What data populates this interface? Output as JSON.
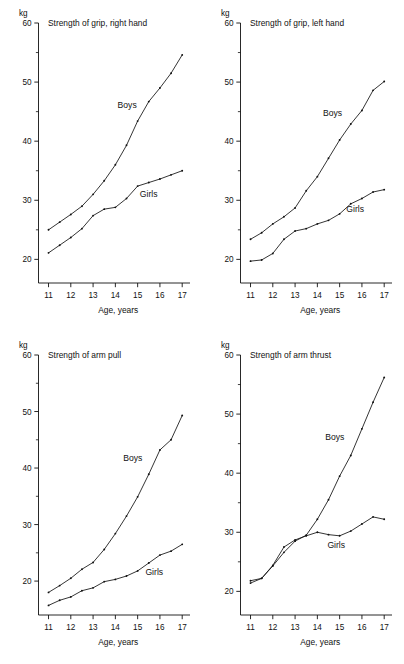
{
  "figure": {
    "panel_count": 4,
    "background": "#ffffff",
    "ink": "#111111"
  },
  "chart_data": [
    {
      "id": "grip-right-hand",
      "type": "line",
      "title": "Strength of grip, right hand",
      "xlabel": "Age, years",
      "ylabel": "kg",
      "unit": "kg",
      "xlim": [
        10.55,
        17.35
      ],
      "ylim": [
        16.0,
        60.0
      ],
      "xticks": [
        11,
        12,
        13,
        14,
        15,
        16,
        17
      ],
      "xticklabels": [
        "11",
        "12",
        "13",
        "14",
        "15",
        "16",
        "17"
      ],
      "yticks": [
        20,
        30,
        40,
        50,
        60
      ],
      "yticklabels": [
        "20",
        "30",
        "40",
        "50",
        "60"
      ],
      "yminorticks": [
        25,
        35,
        45,
        55
      ],
      "grid": false,
      "legend": "inline-annotation",
      "x": [
        11,
        11.5,
        12,
        12.5,
        13,
        13.5,
        14,
        14.5,
        15,
        15.5,
        16,
        16.5,
        17
      ],
      "series": [
        {
          "name": "Boys",
          "label_x": 14.1,
          "label_y": 45.6,
          "values": [
            25.0,
            26.3,
            27.6,
            29.0,
            31.0,
            33.3,
            36.0,
            39.3,
            43.4,
            46.7,
            49.0,
            51.5,
            54.6
          ]
        },
        {
          "name": "Girls",
          "label_x": 15.1,
          "label_y": 30.6,
          "values": [
            21.1,
            22.4,
            23.7,
            25.2,
            27.4,
            28.5,
            28.8,
            30.3,
            32.4,
            33.0,
            33.6,
            34.3,
            35.0
          ]
        }
      ]
    },
    {
      "id": "grip-left-hand",
      "type": "line",
      "title": "Strength of grip, left hand",
      "xlabel": "Age, years",
      "ylabel": "kg",
      "unit": "kg",
      "xlim": [
        10.55,
        17.35
      ],
      "ylim": [
        16.0,
        60.0
      ],
      "xticks": [
        11,
        12,
        13,
        14,
        15,
        16,
        17
      ],
      "xticklabels": [
        "11",
        "12",
        "13",
        "14",
        "15",
        "16",
        "17"
      ],
      "yticks": [
        20,
        30,
        40,
        50,
        60
      ],
      "yticklabels": [
        "20",
        "30",
        "40",
        "50",
        "60"
      ],
      "yminorticks": [
        25,
        35,
        45,
        55
      ],
      "grid": false,
      "legend": "inline-annotation",
      "x": [
        11,
        11.5,
        12,
        12.5,
        13,
        13.5,
        14,
        14.5,
        15,
        15.5,
        16,
        16.5,
        17
      ],
      "series": [
        {
          "name": "Boys",
          "label_x": 14.25,
          "label_y": 44.2,
          "values": [
            23.4,
            24.5,
            26.0,
            27.2,
            28.7,
            31.6,
            34.0,
            37.1,
            40.2,
            42.9,
            45.2,
            48.6,
            50.1
          ]
        },
        {
          "name": "Girls",
          "label_x": 15.3,
          "label_y": 28.0,
          "values": [
            19.7,
            19.9,
            21.0,
            23.4,
            24.8,
            25.2,
            26.0,
            26.6,
            27.7,
            29.4,
            30.3,
            31.4,
            31.8
          ]
        }
      ]
    },
    {
      "id": "arm-pull",
      "type": "line",
      "title": "Strength of arm pull",
      "xlabel": "Age, years",
      "ylabel": "kg",
      "unit": "kg",
      "xlim": [
        10.55,
        17.35
      ],
      "ylim": [
        14.0,
        60.0
      ],
      "xticks": [
        11,
        12,
        13,
        14,
        15,
        16,
        17
      ],
      "xticklabels": [
        "11",
        "12",
        "13",
        "14",
        "15",
        "16",
        "17"
      ],
      "yticks": [
        20,
        30,
        40,
        50,
        60
      ],
      "yticklabels": [
        "20",
        "30",
        "40",
        "50",
        "60"
      ],
      "yminorticks": [
        25,
        35,
        45,
        55
      ],
      "grid": false,
      "legend": "inline-annotation",
      "x": [
        11,
        11.5,
        12,
        12.5,
        13,
        13.5,
        14,
        14.5,
        15,
        15.5,
        16,
        16.5,
        17
      ],
      "series": [
        {
          "name": "Boys",
          "label_x": 14.35,
          "label_y": 41.3,
          "values": [
            18.0,
            19.2,
            20.5,
            22.1,
            23.3,
            25.6,
            28.4,
            31.5,
            34.9,
            38.9,
            43.2,
            45.0,
            49.3
          ]
        },
        {
          "name": "Girls",
          "label_x": 15.35,
          "label_y": 21.0,
          "values": [
            15.7,
            16.6,
            17.2,
            18.3,
            18.8,
            19.9,
            20.3,
            20.9,
            21.8,
            23.2,
            24.6,
            25.3,
            26.5
          ]
        }
      ]
    },
    {
      "id": "arm-thrust",
      "type": "line",
      "title": "Strength of arm thrust",
      "xlabel": "Age, years",
      "ylabel": "kg",
      "unit": "kg",
      "xlim": [
        10.55,
        17.35
      ],
      "ylim": [
        16.0,
        60.0
      ],
      "xticks": [
        11,
        12,
        13,
        14,
        15,
        16,
        17
      ],
      "xticklabels": [
        "11",
        "12",
        "13",
        "14",
        "15",
        "16",
        "17"
      ],
      "yticks": [
        20,
        30,
        40,
        50,
        60
      ],
      "yticklabels": [
        "20",
        "30",
        "40",
        "50",
        "60"
      ],
      "yminorticks": [
        25,
        35,
        45,
        55
      ],
      "grid": false,
      "legend": "inline-annotation",
      "x": [
        11,
        11.5,
        12,
        12.5,
        13,
        13.5,
        14,
        14.5,
        15,
        15.5,
        16,
        16.5,
        17
      ],
      "series": [
        {
          "name": "Boys",
          "label_x": 14.35,
          "label_y": 45.6,
          "values": [
            21.4,
            22.2,
            24.3,
            26.6,
            28.5,
            29.5,
            32.2,
            35.5,
            39.5,
            43.0,
            47.5,
            52.0,
            56.2
          ]
        },
        {
          "name": "Girls",
          "label_x": 14.45,
          "label_y": 27.3,
          "values": [
            21.8,
            22.2,
            24.4,
            27.5,
            28.7,
            29.4,
            30.0,
            29.6,
            29.4,
            30.2,
            31.4,
            32.6,
            32.2
          ]
        }
      ]
    }
  ]
}
